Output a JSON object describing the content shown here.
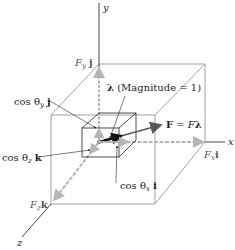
{
  "diagram": {
    "axes": {
      "x": "x",
      "y": "y",
      "z": "z"
    },
    "labels": {
      "lambda": "λ",
      "lambda_note": "(Magnitude = 1)",
      "force_F": "F",
      "force_eq": "= F",
      "force_lambda": "λ",
      "Fx_F": "F",
      "Fx_sub": "x",
      "Fx_unit": "i",
      "Fy_F": "F",
      "Fy_sub": "y",
      "Fy_unit": "j",
      "Fz_F": "F",
      "Fz_sub": "z",
      "Fz_unit": "k",
      "cos_x_prefix": "cos θ",
      "cos_x_sub": "x",
      "cos_x_unit": "i",
      "cos_y_prefix": "cos θ",
      "cos_y_sub": "y",
      "cos_y_unit": "j",
      "cos_z_prefix": "cos θ",
      "cos_z_sub": "z",
      "cos_z_unit": "k"
    },
    "colors": {
      "axis": "#333333",
      "box_edge": "#8a8a8a",
      "component_arrow": "#b5b5b5",
      "force_arrow": "#5a5a5a",
      "unit_vector": "#111111"
    }
  }
}
